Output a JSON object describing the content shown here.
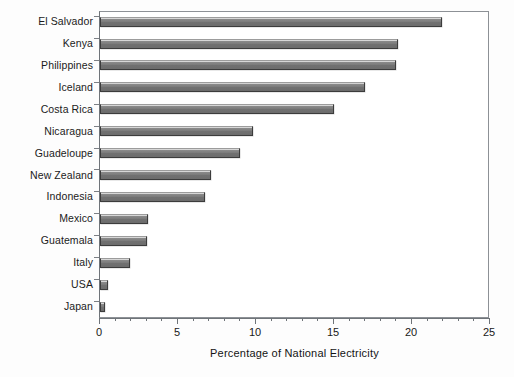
{
  "chart_data": {
    "type": "bar",
    "orientation": "horizontal",
    "title": "",
    "subtitle": "",
    "xlabel": "Percentage of National Electricity",
    "ylabel": "",
    "xlim": [
      0,
      25
    ],
    "xticks": [
      0,
      5,
      10,
      15,
      20,
      25
    ],
    "xtick_labels": [
      "0",
      "5",
      "10",
      "15",
      "20",
      "25"
    ],
    "minor_tick_step": 1,
    "grid": false,
    "legend": null,
    "bar_color": "#6e6e6e",
    "bar_edge_color": "#3c3c3c",
    "categories": [
      "El Salvador",
      "Kenya",
      "Philippines",
      "Iceland",
      "Costa Rica",
      "Nicaragua",
      "Guadeloupe",
      "New Zealand",
      "Indonesia",
      "Mexico",
      "Guatemala",
      "Italy",
      "USA",
      "Japan"
    ],
    "values": [
      21.9,
      19.1,
      19.0,
      17.0,
      15.0,
      9.8,
      9.0,
      7.1,
      6.7,
      3.1,
      3.0,
      1.9,
      0.5,
      0.3
    ]
  },
  "axis": {
    "x_title": "Percentage of National Electricity"
  }
}
